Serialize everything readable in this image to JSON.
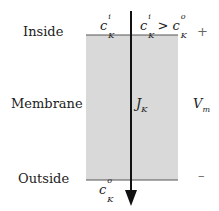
{
  "labels": {
    "inside": "Inside",
    "membrane": "Membrane",
    "outside": "Outside",
    "plus": "+",
    "minus": "–",
    "vm_base": "V",
    "vm_sub": "m",
    "jk_base": "J",
    "jk_sub": "K",
    "ci_base": "c",
    "ci_sup": "i",
    "ci_sub": "K",
    "co_base": "c",
    "co_sup": "o",
    "co_sub": "K",
    "gt": ">"
  },
  "colors": {
    "membrane_fill": "#d9d9d9",
    "line": "#555555",
    "arrow": "#111111"
  }
}
